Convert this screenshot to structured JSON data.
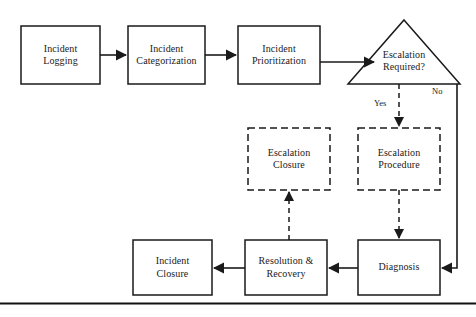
{
  "diagram": {
    "type": "flowchart",
    "colors": {
      "background": "#ffffff",
      "stroke": "#1a1a1a",
      "text": "#1a1a1a",
      "rule": "#111111"
    },
    "nodes": [
      {
        "id": "incident-logging",
        "shape": "rectangle",
        "style": "solid",
        "lines": [
          "Incident",
          "Logging"
        ],
        "x": 21,
        "y": 26,
        "w": 79,
        "h": 58
      },
      {
        "id": "incident-categorization",
        "shape": "rectangle",
        "style": "solid",
        "lines": [
          "Incident",
          "Categorization"
        ],
        "x": 128,
        "y": 26,
        "w": 77,
        "h": 58
      },
      {
        "id": "incident-prioritization",
        "shape": "rectangle",
        "style": "solid",
        "lines": [
          "Incident",
          "Prioritization"
        ],
        "x": 238,
        "y": 26,
        "w": 82,
        "h": 58
      },
      {
        "id": "escalation-required",
        "shape": "triangle",
        "style": "solid",
        "lines": [
          "Escalation",
          "Required?"
        ],
        "x": 348,
        "y": 20,
        "w": 112,
        "h": 64
      },
      {
        "id": "escalation-closure",
        "shape": "rectangle",
        "style": "dashed",
        "lines": [
          "Escalation",
          "Closure"
        ],
        "x": 248,
        "y": 128,
        "w": 82,
        "h": 62
      },
      {
        "id": "escalation-procedure",
        "shape": "rectangle",
        "style": "dashed",
        "lines": [
          "Escalation",
          "Procedure"
        ],
        "x": 358,
        "y": 128,
        "w": 82,
        "h": 62
      },
      {
        "id": "incident-closure",
        "shape": "rectangle",
        "style": "solid",
        "lines": [
          "Incident",
          "Closure"
        ],
        "x": 133,
        "y": 240,
        "w": 79,
        "h": 55
      },
      {
        "id": "resolution-recovery",
        "shape": "rectangle",
        "style": "solid",
        "lines": [
          "Resolution &",
          "Recovery"
        ],
        "x": 245,
        "y": 240,
        "w": 82,
        "h": 55
      },
      {
        "id": "diagnosis",
        "shape": "rectangle",
        "style": "solid",
        "lines": [
          "Diagnosis"
        ],
        "x": 358,
        "y": 240,
        "w": 82,
        "h": 55
      }
    ],
    "edge_labels": [
      {
        "id": "yes-label",
        "text": "Yes",
        "x": 374,
        "y": 98
      },
      {
        "id": "no-label",
        "text": "No",
        "x": 432,
        "y": 86
      }
    ],
    "edges": [
      {
        "id": "logging-to-categorization",
        "from": "incident-logging",
        "to": "incident-categorization",
        "style": "solid"
      },
      {
        "id": "categorization-to-prioritization",
        "from": "incident-categorization",
        "to": "incident-prioritization",
        "style": "solid"
      },
      {
        "id": "prioritization-to-decision",
        "from": "incident-prioritization",
        "to": "escalation-required",
        "style": "solid"
      },
      {
        "id": "decision-yes-to-procedure",
        "from": "escalation-required",
        "to": "escalation-procedure",
        "style": "dashed",
        "label": "Yes"
      },
      {
        "id": "decision-no-to-diagnosis",
        "from": "escalation-required",
        "to": "diagnosis",
        "style": "solid",
        "label": "No"
      },
      {
        "id": "procedure-to-diagnosis",
        "from": "escalation-procedure",
        "to": "diagnosis",
        "style": "dashed"
      },
      {
        "id": "diagnosis-to-resolution",
        "from": "diagnosis",
        "to": "resolution-recovery",
        "style": "solid"
      },
      {
        "id": "resolution-to-closure",
        "from": "resolution-recovery",
        "to": "incident-closure",
        "style": "solid"
      },
      {
        "id": "resolution-to-escalation-closure",
        "from": "resolution-recovery",
        "to": "escalation-closure",
        "style": "dashed"
      }
    ],
    "footer_rule": {
      "id": "bottom-rule",
      "y": 303
    }
  }
}
